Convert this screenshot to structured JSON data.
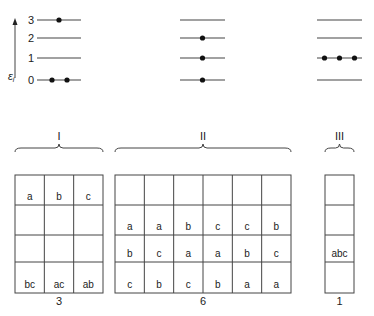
{
  "axis": {
    "label": "ε",
    "label_sub": "i",
    "level_labels": [
      "0",
      "1",
      "2",
      "3"
    ]
  },
  "energy_panels": [
    {
      "name": "I",
      "particles_per_level": {
        "0": 2,
        "1": 0,
        "2": 0,
        "3": 1
      }
    },
    {
      "name": "II",
      "particles_per_level": {
        "0": 1,
        "1": 1,
        "2": 1,
        "3": 0
      }
    },
    {
      "name": "III",
      "particles_per_level": {
        "0": 0,
        "1": 3,
        "2": 0,
        "3": 0
      }
    }
  ],
  "groups": [
    {
      "roman": "I",
      "count": "3",
      "columns": [
        [
          "bc",
          "",
          "",
          "a"
        ],
        [
          "ac",
          "",
          "",
          "b"
        ],
        [
          "ab",
          "",
          "",
          "c"
        ]
      ]
    },
    {
      "roman": "II",
      "count": "6",
      "columns": [
        [
          "c",
          "b",
          "a",
          ""
        ],
        [
          "b",
          "c",
          "a",
          ""
        ],
        [
          "c",
          "a",
          "b",
          ""
        ],
        [
          "b",
          "a",
          "c",
          ""
        ],
        [
          "a",
          "b",
          "c",
          ""
        ],
        [
          "a",
          "c",
          "b",
          ""
        ]
      ]
    },
    {
      "roman": "III",
      "count": "1",
      "columns": [
        [
          "",
          "abc",
          "",
          ""
        ]
      ]
    }
  ],
  "colors": {
    "line": "#444444",
    "dot": "#111111"
  }
}
